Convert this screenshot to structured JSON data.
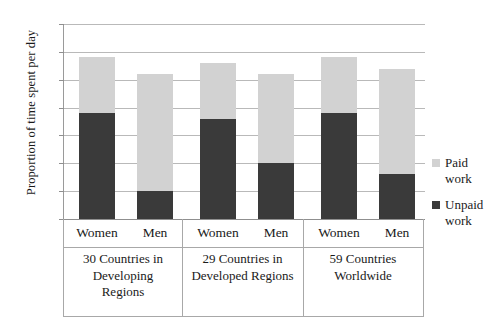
{
  "chart_data": {
    "type": "bar",
    "subtype": "stacked-bar",
    "title": "",
    "xlabel": "",
    "ylabel": "Proportion of time spent per day",
    "ylim": [
      0,
      35
    ],
    "yticks": [
      0,
      5,
      10,
      15,
      20,
      25,
      30,
      35
    ],
    "ytick_labels": [
      "0",
      "5",
      "10",
      "15",
      "20",
      "25",
      "30",
      "35"
    ],
    "grid": true,
    "grid_axis": "y",
    "legend_position": "right",
    "categories": [
      "Women",
      "Men",
      "Women",
      "Men",
      "Women",
      "Men"
    ],
    "groups": [
      {
        "label_lines": [
          "30 Countries in",
          "Developing",
          "Regions"
        ],
        "label": "30 Countries in Developing Regions",
        "bars": [
          {
            "category": "Women",
            "unpaid_work": 19,
            "paid_work": 10,
            "total": 29
          },
          {
            "category": "Men",
            "unpaid_work": 5,
            "paid_work": 21,
            "total": 26
          }
        ]
      },
      {
        "label_lines": [
          "29 Countries in",
          "Developed Regions"
        ],
        "label": "29 Countries in Developed Regions",
        "bars": [
          {
            "category": "Women",
            "unpaid_work": 18,
            "paid_work": 10,
            "total": 28
          },
          {
            "category": "Men",
            "unpaid_work": 10,
            "paid_work": 16,
            "total": 26
          }
        ]
      },
      {
        "label_lines": [
          "59 Countries",
          "Worldwide"
        ],
        "label": "59 Countries Worldwide",
        "bars": [
          {
            "category": "Women",
            "unpaid_work": 19,
            "paid_work": 10,
            "total": 29
          },
          {
            "category": "Men",
            "unpaid_work": 8,
            "paid_work": 19,
            "total": 27
          }
        ]
      }
    ],
    "series": [
      {
        "name": "Unpaid work",
        "color": "#3a3a3a",
        "values": [
          19,
          5,
          18,
          10,
          19,
          8
        ]
      },
      {
        "name": "Paid work",
        "color": "#d2d2d2",
        "values": [
          10,
          21,
          10,
          16,
          10,
          19
        ]
      }
    ]
  },
  "legend": {
    "items": [
      {
        "label_line1": "Paid",
        "label_line2": "work",
        "label": "Paid work",
        "color": "#d2d2d2"
      },
      {
        "label_line1": "Unpaid",
        "label_line2": "work",
        "label": "Unpaid work",
        "color": "#3a3a3a"
      }
    ]
  },
  "colors": {
    "paid_work": "#d2d2d2",
    "unpaid_work": "#3a3a3a",
    "gridline": "#b9b9b9",
    "axis": "#8f8f8f",
    "frame": "#a8a8a8",
    "background": "#ffffff",
    "text": "#1a1a1a"
  }
}
